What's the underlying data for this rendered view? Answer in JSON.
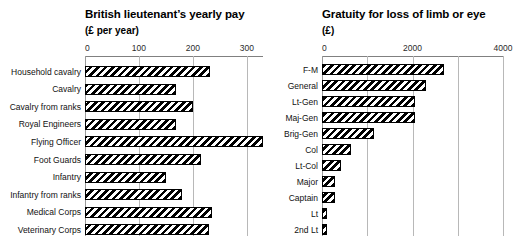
{
  "chart_data": [
    {
      "type": "bar",
      "orientation": "horizontal",
      "title": "British lieutenant’s yearly pay",
      "subtitle": "(£ per year)",
      "xlabel": "",
      "ylabel": "",
      "xlim": [
        0,
        330
      ],
      "ticks": [
        0,
        100,
        200,
        300
      ],
      "tick_labels": [
        "0",
        "100",
        "200",
        "300"
      ],
      "grid": true,
      "legend": "none",
      "categories": [
        "Household cavalry",
        "Cavalry",
        "Cavalry from ranks",
        "Royal Engineers",
        "Flying Officer",
        "Foot Guards",
        "Infantry",
        "Infantry from ranks",
        "Medical Corps",
        "Veterinary Corps"
      ],
      "values": [
        232,
        168,
        200,
        168,
        330,
        215,
        150,
        180,
        235,
        230
      ]
    },
    {
      "type": "bar",
      "orientation": "horizontal",
      "title": "Gratuity for loss of limb or eye",
      "subtitle": "(£)",
      "xlabel": "",
      "ylabel": "",
      "xlim": [
        0,
        4000
      ],
      "ticks": [
        0,
        2000,
        4000
      ],
      "tick_labels": [
        "0",
        "2000",
        "4000"
      ],
      "minor_ticks": [
        1000,
        3000
      ],
      "grid": true,
      "legend": "none",
      "categories": [
        "F-M",
        "General",
        "Lt-Gen",
        "Maj-Gen",
        "Brig-Gen",
        "Col",
        "Lt-Col",
        "Major",
        "Captain",
        "Lt",
        "2nd Lt"
      ],
      "values": [
        2700,
        2300,
        2050,
        2050,
        1140,
        650,
        430,
        280,
        280,
        110,
        110
      ]
    }
  ],
  "style": {
    "bar_fill": "#ffffff",
    "bar_hatch": "#000000",
    "bar_edge": "#000000",
    "grid_color": "#b8b8b8",
    "axis_color": "#808080",
    "text_color": "#111111",
    "background": "#ffffff"
  }
}
